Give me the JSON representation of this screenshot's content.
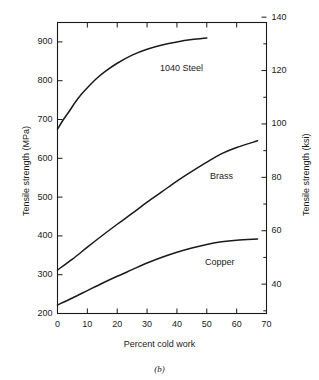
{
  "figure": {
    "caption": "(b)"
  },
  "chart_data": {
    "type": "line",
    "title": "",
    "xlabel": "Percent cold work",
    "ylabel": "Tensile strength (MPa)",
    "ylabel_secondary": "Tensile strength (ksi)",
    "xlim": [
      0,
      70
    ],
    "ylim": [
      200,
      950
    ],
    "ylim_secondary": [
      29,
      138
    ],
    "grid": false,
    "legend_position": "inline-curve-labels",
    "xticks": [
      0,
      10,
      20,
      30,
      40,
      50,
      60,
      70
    ],
    "xtick_labels": [
      "0",
      "10",
      "20",
      "30",
      "40",
      "50",
      "60",
      "70"
    ],
    "yticks": [
      200,
      300,
      400,
      500,
      600,
      700,
      800,
      900
    ],
    "ytick_labels": [
      "200",
      "300",
      "400",
      "500",
      "600",
      "700",
      "800",
      "900"
    ],
    "yticks_secondary": [
      40,
      60,
      80,
      100,
      120,
      140
    ],
    "ytick_labels_secondary": [
      "40",
      "60",
      "80",
      "100",
      "120",
      "140"
    ],
    "yticks_secondary_minor": [
      30,
      50,
      70,
      90,
      110,
      130
    ],
    "series": [
      {
        "name": "1040 Steel",
        "label": "1040 Steel",
        "color": "#1a1a1a",
        "x": [
          0,
          2,
          4,
          6,
          8,
          10,
          13,
          16,
          20,
          25,
          30,
          35,
          40,
          45,
          50
        ],
        "y": [
          675,
          700,
          722,
          745,
          765,
          782,
          805,
          824,
          845,
          866,
          881,
          892,
          900,
          906,
          910
        ]
      },
      {
        "name": "Brass",
        "label": "Brass",
        "color": "#1a1a1a",
        "x": [
          0,
          5,
          10,
          15,
          20,
          25,
          30,
          35,
          40,
          45,
          50,
          55,
          60,
          67
        ],
        "y": [
          312,
          340,
          371,
          401,
          430,
          458,
          487,
          514,
          541,
          566,
          590,
          612,
          628,
          645
        ]
      },
      {
        "name": "Copper",
        "label": "Copper",
        "color": "#1a1a1a",
        "x": [
          0,
          5,
          10,
          15,
          20,
          25,
          30,
          35,
          40,
          45,
          50,
          55,
          60,
          67
        ],
        "y": [
          222,
          240,
          259,
          278,
          296,
          313,
          330,
          345,
          358,
          369,
          378,
          385,
          389,
          392
        ]
      }
    ]
  }
}
